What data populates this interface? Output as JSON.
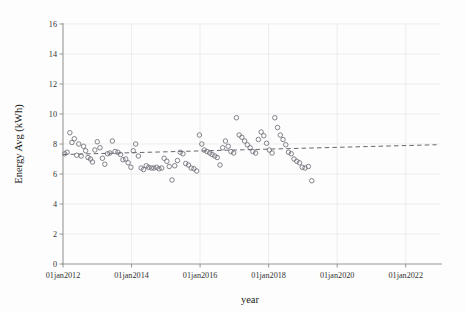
{
  "chart_data": {
    "type": "scatter",
    "title": "",
    "xlabel": "year",
    "ylabel": "Energy Avg (kWh)",
    "xlim": [
      "01jan2012",
      "01jan2023"
    ],
    "ylim": [
      0,
      16
    ],
    "grid": true,
    "legend": "none",
    "y_ticks": [
      0,
      2,
      4,
      6,
      8,
      10,
      12,
      14,
      16
    ],
    "y_tick_labels": [
      "0",
      "2",
      "4",
      "6",
      "8",
      "10",
      "12",
      "14",
      "16"
    ],
    "x_ticks": [
      2012,
      2014,
      2016,
      2018,
      2020,
      2022
    ],
    "x_tick_labels": [
      "01jan2012",
      "01jan2014",
      "01jan2016",
      "01jan2018",
      "01jan2020",
      "01jan2022"
    ],
    "marker": "open-circle",
    "marker_color": "#6e6e78",
    "series": [
      {
        "name": "Energy Avg (kWh)",
        "points": [
          [
            2012.05,
            7.35
          ],
          [
            2012.12,
            7.45
          ],
          [
            2012.2,
            8.75
          ],
          [
            2012.26,
            8.1
          ],
          [
            2012.33,
            8.35
          ],
          [
            2012.4,
            7.25
          ],
          [
            2012.46,
            8.0
          ],
          [
            2012.53,
            7.2
          ],
          [
            2012.6,
            7.85
          ],
          [
            2012.66,
            7.55
          ],
          [
            2012.73,
            7.1
          ],
          [
            2012.8,
            7.0
          ],
          [
            2012.86,
            6.8
          ],
          [
            2012.93,
            7.6
          ],
          [
            2013.0,
            8.15
          ],
          [
            2013.08,
            7.75
          ],
          [
            2013.15,
            7.05
          ],
          [
            2013.22,
            6.65
          ],
          [
            2013.3,
            7.35
          ],
          [
            2013.37,
            7.4
          ],
          [
            2013.44,
            8.2
          ],
          [
            2013.52,
            7.5
          ],
          [
            2013.6,
            7.45
          ],
          [
            2013.68,
            7.3
          ],
          [
            2013.75,
            6.95
          ],
          [
            2013.83,
            7.0
          ],
          [
            2013.9,
            6.75
          ],
          [
            2013.98,
            6.45
          ],
          [
            2014.05,
            7.55
          ],
          [
            2014.12,
            8.0
          ],
          [
            2014.2,
            7.2
          ],
          [
            2014.28,
            6.4
          ],
          [
            2014.35,
            6.3
          ],
          [
            2014.43,
            6.55
          ],
          [
            2014.5,
            6.45
          ],
          [
            2014.58,
            6.4
          ],
          [
            2014.65,
            6.4
          ],
          [
            2014.73,
            6.45
          ],
          [
            2014.8,
            6.35
          ],
          [
            2014.88,
            6.4
          ],
          [
            2014.95,
            7.05
          ],
          [
            2015.03,
            6.85
          ],
          [
            2015.1,
            6.5
          ],
          [
            2015.18,
            5.6
          ],
          [
            2015.26,
            6.55
          ],
          [
            2015.34,
            6.9
          ],
          [
            2015.42,
            7.45
          ],
          [
            2015.5,
            7.35
          ],
          [
            2015.58,
            6.7
          ],
          [
            2015.66,
            6.6
          ],
          [
            2015.74,
            6.4
          ],
          [
            2015.82,
            6.35
          ],
          [
            2015.9,
            6.2
          ],
          [
            2015.98,
            8.6
          ],
          [
            2016.05,
            8.0
          ],
          [
            2016.12,
            7.6
          ],
          [
            2016.2,
            7.5
          ],
          [
            2016.28,
            7.4
          ],
          [
            2016.35,
            7.3
          ],
          [
            2016.43,
            7.2
          ],
          [
            2016.5,
            7.1
          ],
          [
            2016.58,
            6.6
          ],
          [
            2016.66,
            7.75
          ],
          [
            2016.74,
            8.2
          ],
          [
            2016.82,
            7.85
          ],
          [
            2016.9,
            7.5
          ],
          [
            2016.98,
            7.4
          ],
          [
            2017.06,
            9.75
          ],
          [
            2017.14,
            8.6
          ],
          [
            2017.22,
            8.45
          ],
          [
            2017.3,
            8.2
          ],
          [
            2017.38,
            7.95
          ],
          [
            2017.46,
            7.75
          ],
          [
            2017.54,
            7.5
          ],
          [
            2017.62,
            7.4
          ],
          [
            2017.7,
            8.3
          ],
          [
            2017.78,
            8.8
          ],
          [
            2017.86,
            8.55
          ],
          [
            2017.94,
            8.05
          ],
          [
            2018.02,
            7.6
          ],
          [
            2018.1,
            7.4
          ],
          [
            2018.18,
            9.75
          ],
          [
            2018.26,
            9.1
          ],
          [
            2018.34,
            8.6
          ],
          [
            2018.42,
            8.3
          ],
          [
            2018.5,
            7.95
          ],
          [
            2018.58,
            7.45
          ],
          [
            2018.66,
            7.35
          ],
          [
            2018.74,
            7.0
          ],
          [
            2018.82,
            6.85
          ],
          [
            2018.9,
            6.75
          ],
          [
            2018.98,
            6.45
          ],
          [
            2019.06,
            6.4
          ],
          [
            2019.16,
            6.5
          ],
          [
            2019.26,
            5.55
          ]
        ]
      }
    ],
    "trendline": {
      "style": "dashed",
      "x_start": 2012.0,
      "y_start": 7.3,
      "x_end": 2022.9,
      "y_end": 7.95
    }
  }
}
